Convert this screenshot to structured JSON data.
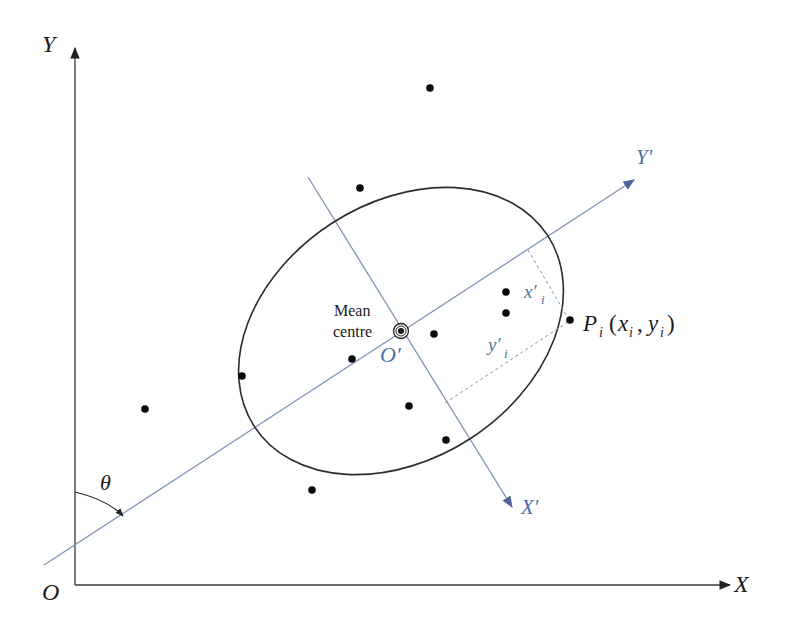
{
  "diagram": {
    "title": "",
    "axes": {
      "x_label": "X",
      "y_label": "Y",
      "origin_label": "O",
      "angle_label": "θ"
    },
    "rotated_axes": {
      "x_label": "X′",
      "y_label": "Y′",
      "origin_label": "O′"
    },
    "mean_centre": {
      "label_line1": "Mean",
      "label_line2": "centre"
    },
    "point": {
      "name": "P",
      "subscript": "i",
      "coords_open": "(",
      "x": "x",
      "x_sub": "i",
      "comma": ",",
      "y": "y",
      "y_sub": "i",
      "coords_close": ")"
    },
    "projections": {
      "x_prime": "x′",
      "x_prime_sub": "i",
      "y_prime": "y′",
      "y_prime_sub": "i"
    },
    "colors": {
      "axis": "#3a3a3a",
      "rotated_axis": "#7e93b8",
      "label_blue": "#4a6fa5",
      "ellipse": "#2b2b2b",
      "dot": "#0a0a0a"
    },
    "points": [
      {
        "x": 430,
        "y": 88
      },
      {
        "x": 360,
        "y": 188
      },
      {
        "x": 145,
        "y": 409
      },
      {
        "x": 312,
        "y": 490
      },
      {
        "x": 242,
        "y": 376
      },
      {
        "x": 352,
        "y": 359
      },
      {
        "x": 434,
        "y": 334
      },
      {
        "x": 506,
        "y": 292
      },
      {
        "x": 506,
        "y": 313
      },
      {
        "x": 570,
        "y": 320
      },
      {
        "x": 409,
        "y": 406
      },
      {
        "x": 446,
        "y": 440
      }
    ],
    "mean_centre_position": {
      "x": 401,
      "y": 331
    }
  }
}
